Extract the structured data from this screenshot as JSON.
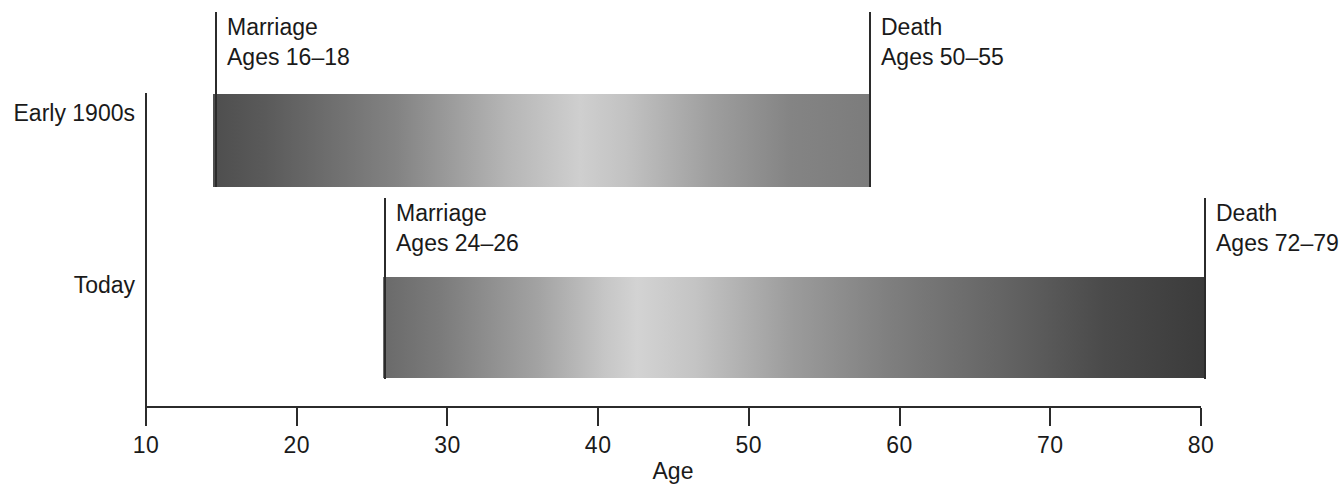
{
  "chart_data": {
    "type": "bar",
    "title": "",
    "subtitle": "",
    "xlabel": "Age",
    "ylabel": "",
    "xlim": [
      10,
      80
    ],
    "ylim": null,
    "grid": false,
    "legend": null,
    "orientation": "horizontal",
    "categories": [
      "Early 1900s",
      "Today"
    ],
    "x_ticks": [
      10,
      20,
      30,
      40,
      50,
      60,
      70,
      80
    ],
    "x_tick_labels": [
      "10",
      "20",
      "30",
      "40",
      "50",
      "60",
      "70",
      "80"
    ],
    "series": [
      {
        "name": "Early 1900s",
        "category": "Early 1900s",
        "start_age": 14.5,
        "end_age": 55,
        "span_years": 40.5,
        "fill": "gradient-dark-to-light-to-mid"
      },
      {
        "name": "Today",
        "category": "Today",
        "start_age": 25,
        "end_age": 75.5,
        "span_years": 50.5,
        "fill": "gradient-mid-to-light-to-dark"
      }
    ],
    "annotations": [
      {
        "id": "marriage-early-1900s",
        "row": "Early 1900s",
        "event": "Marriage",
        "ages": "Ages 16–18",
        "age_low": 16,
        "age_high": 18,
        "marker_age": 14.5
      },
      {
        "id": "death-early-1900s",
        "row": "Early 1900s",
        "event": "Death",
        "ages": "Ages 50–55",
        "age_low": 50,
        "age_high": 55,
        "marker_age": 55
      },
      {
        "id": "marriage-today",
        "row": "Today",
        "event": "Marriage",
        "ages": "Ages 24–26",
        "age_low": 24,
        "age_high": 26,
        "marker_age": 25
      },
      {
        "id": "death-today",
        "row": "Today",
        "event": "Death",
        "ages": "Ages 72–79",
        "age_low": 72,
        "age_high": 79,
        "marker_age": 75.5
      }
    ]
  },
  "axis": {
    "x_title": "Age",
    "tick_labels": [
      "10",
      "20",
      "30",
      "40",
      "50",
      "60",
      "70",
      "80"
    ]
  },
  "rows": [
    {
      "label": "Early 1900s"
    },
    {
      "label": "Today"
    }
  ],
  "annotations": [
    {
      "event": "Marriage",
      "ages": "Ages 16–18"
    },
    {
      "event": "Death",
      "ages": "Ages 50–55"
    },
    {
      "event": "Marriage",
      "ages": "Ages 24–26"
    },
    {
      "event": "Death",
      "ages": "Ages 72–79"
    }
  ],
  "colors": {
    "axis": "#2b2b2b",
    "text": "#1a1a1a",
    "background": "#ffffff",
    "bar_dark": "#3b3b3b",
    "bar_mid": "#7d7d7d",
    "bar_light": "#d3d3d3"
  }
}
